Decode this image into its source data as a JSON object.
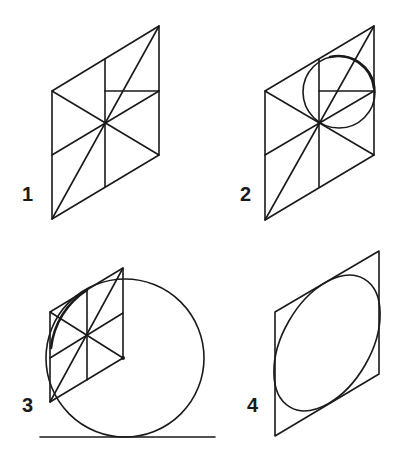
{
  "diagram": {
    "stroke_color": "#1a1a1a",
    "background": "#ffffff",
    "steps": [
      {
        "id": 1,
        "label": "1",
        "caption": "Isometric square divided by diagonals, center lines and half-lines"
      },
      {
        "id": 2,
        "label": "2",
        "caption": "Circle drawn in upper-right quadrant through center"
      },
      {
        "id": 3,
        "label": "3",
        "caption": "Large circle tangent to baseline, arc traced on rhombus"
      },
      {
        "id": 4,
        "label": "4",
        "caption": "Resulting ellipse inscribed in isometric square"
      }
    ]
  }
}
